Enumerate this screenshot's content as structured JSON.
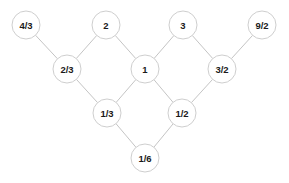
{
  "diagram": {
    "background_color": "#ffffff",
    "node_fill_color": "#ffffff",
    "node_stroke_color": "#c8c8c8",
    "edge_color": "#bdbdbd",
    "label_color": "#1a1a1a",
    "node_radius": 14,
    "nodes": [
      {
        "id": "n_4_3",
        "label": "4/3",
        "x": 26,
        "y": 25,
        "row": 0
      },
      {
        "id": "n_2",
        "label": "2",
        "x": 106,
        "y": 25,
        "row": 0
      },
      {
        "id": "n_3",
        "label": "3",
        "x": 183,
        "y": 25,
        "row": 0
      },
      {
        "id": "n_9_2",
        "label": "9/2",
        "x": 262,
        "y": 25,
        "row": 0
      },
      {
        "id": "n_2_3",
        "label": "2/3",
        "x": 67,
        "y": 69,
        "row": 1
      },
      {
        "id": "n_1",
        "label": "1",
        "x": 145,
        "y": 69,
        "row": 1
      },
      {
        "id": "n_3_2",
        "label": "3/2",
        "x": 222,
        "y": 69,
        "row": 1
      },
      {
        "id": "n_1_3",
        "label": "1/3",
        "x": 107,
        "y": 113,
        "row": 2
      },
      {
        "id": "n_1_2",
        "label": "1/2",
        "x": 182,
        "y": 113,
        "row": 2
      },
      {
        "id": "n_1_6",
        "label": "1/6",
        "x": 145,
        "y": 158,
        "row": 3
      }
    ],
    "edges": [
      {
        "from": "n_4_3",
        "to": "n_2_3"
      },
      {
        "from": "n_2",
        "to": "n_2_3"
      },
      {
        "from": "n_2",
        "to": "n_1"
      },
      {
        "from": "n_3",
        "to": "n_1"
      },
      {
        "from": "n_3",
        "to": "n_3_2"
      },
      {
        "from": "n_9_2",
        "to": "n_3_2"
      },
      {
        "from": "n_2_3",
        "to": "n_1_3"
      },
      {
        "from": "n_1",
        "to": "n_1_3"
      },
      {
        "from": "n_1",
        "to": "n_1_2"
      },
      {
        "from": "n_3_2",
        "to": "n_1_2"
      },
      {
        "from": "n_1_3",
        "to": "n_1_6"
      },
      {
        "from": "n_1_2",
        "to": "n_1_6"
      }
    ]
  }
}
